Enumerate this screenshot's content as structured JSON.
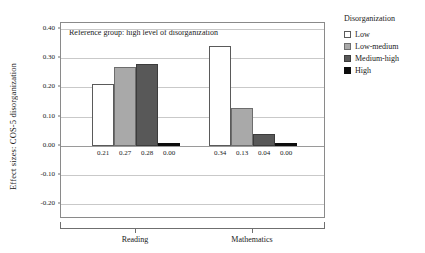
{
  "chart_data": {
    "type": "bar",
    "title": "",
    "subtitle": "",
    "xlabel": "",
    "ylabel": "Effect sizes: COS-5 disorganization",
    "categories": [
      "Reading",
      "Mathematics"
    ],
    "series": [
      {
        "name": "Low",
        "values": [
          0.21,
          0.34
        ],
        "labels": [
          "0.21",
          "0.34"
        ],
        "color": "#ffffff"
      },
      {
        "name": "Low-medium",
        "values": [
          0.27,
          0.13
        ],
        "labels": [
          "0.27",
          "0.13"
        ],
        "color": "#a9a9a9"
      },
      {
        "name": "Medium-high",
        "values": [
          0.28,
          0.04
        ],
        "labels": [
          "0.28",
          "0.04"
        ],
        "color": "#585858"
      },
      {
        "name": "High",
        "values": [
          0.0,
          0.0
        ],
        "labels": [
          "0.00",
          "0.00"
        ],
        "color": "#0d0d0d"
      }
    ],
    "ylim": [
      -0.25,
      0.42
    ],
    "yticks": [
      "0.40",
      "0.30",
      "0.20",
      "0.10",
      "0.00",
      "-0.10",
      "-0.20"
    ],
    "ytick_values": [
      0.4,
      0.3,
      0.2,
      0.1,
      0.0,
      -0.1,
      -0.2
    ],
    "grid": true,
    "legend_position": "right",
    "annotation": "Reference group: high level of disorganization"
  },
  "legend": {
    "title": "Disorganization",
    "items": [
      {
        "label": "Low"
      },
      {
        "label": "Low-medium"
      },
      {
        "label": "Medium-high"
      },
      {
        "label": "High"
      }
    ]
  }
}
